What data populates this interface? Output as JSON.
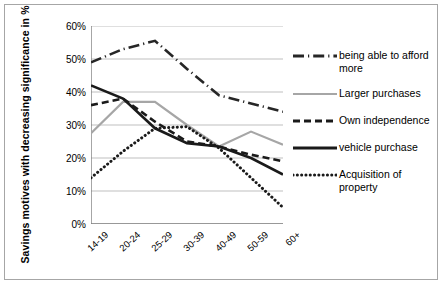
{
  "chart_data": {
    "type": "line",
    "title": "",
    "xlabel": "",
    "ylabel": "Savings motives with decreasing significance in %",
    "categories": [
      "14-19",
      "20-24",
      "25-29",
      "30-39",
      "40-49",
      "50-59",
      "60+"
    ],
    "ylim": [
      0,
      60
    ],
    "yticks": [
      "0%",
      "10%",
      "20%",
      "30%",
      "40%",
      "50%",
      "60%"
    ],
    "ytick_values": [
      0,
      10,
      20,
      30,
      40,
      50,
      60
    ],
    "grid": true,
    "legend_position": "right",
    "series": [
      {
        "name": "being able to afford more",
        "style": "dash-dot",
        "color": "#262626",
        "values": [
          49,
          53,
          55.5,
          47,
          39,
          36.5,
          34
        ]
      },
      {
        "name": "Larger purchases",
        "style": "solid",
        "color": "#a6a6a6",
        "values": [
          27.5,
          37,
          37,
          30,
          23.5,
          28,
          24
        ]
      },
      {
        "name": "Own independence",
        "style": "dashed",
        "color": "#1a1a1a",
        "values": [
          36,
          38,
          31,
          25,
          23.5,
          21,
          19
        ]
      },
      {
        "name": "vehicle purchase",
        "style": "solid",
        "color": "#1a1a1a",
        "values": [
          42,
          38,
          29,
          24.5,
          23.5,
          20,
          15
        ]
      },
      {
        "name": "Acquisition of property",
        "style": "dotted",
        "color": "#1a1a1a",
        "values": [
          14,
          22,
          29,
          29.5,
          23,
          14,
          5
        ]
      }
    ]
  },
  "legend": {
    "items": [
      {
        "label": "being able to afford more"
      },
      {
        "label": "Larger purchases"
      },
      {
        "label": "Own independence"
      },
      {
        "label": "vehicle purchase"
      },
      {
        "label": "Acquisition of property"
      }
    ]
  }
}
